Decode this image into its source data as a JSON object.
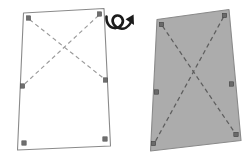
{
  "diagram": {
    "background_color": "#ffffff",
    "outline_color": "#8a8a8a",
    "dash_color_light": "#9a9a9a",
    "dash_color_dark": "#5e5e5e",
    "marker_color": "#6f6f6f",
    "fill_gray": "#acacac",
    "arrow_color": "#1b1b1b"
  },
  "left_panel": {
    "name": "unpainted-panel",
    "label": "",
    "fill": "none",
    "corners": [
      {
        "name": "top-left",
        "x": 23.5,
        "y": 13.0
      },
      {
        "name": "top-right",
        "x": 104.0,
        "y": 8.5
      },
      {
        "name": "bottom-right",
        "x": 110.5,
        "y": 146.0
      },
      {
        "name": "bottom-left",
        "x": 17.5,
        "y": 150.0
      }
    ],
    "markers": [
      {
        "name": "marker-top-left",
        "x": 28.5,
        "y": 18.0
      },
      {
        "name": "marker-top-right",
        "x": 99.5,
        "y": 14.0
      },
      {
        "name": "marker-mid-left",
        "x": 22.5,
        "y": 86.0
      },
      {
        "name": "marker-mid-right",
        "x": 105.5,
        "y": 80.0
      },
      {
        "name": "marker-bottom-left",
        "x": 24.0,
        "y": 143.0
      },
      {
        "name": "marker-bottom-right",
        "x": 105.0,
        "y": 139.0
      }
    ],
    "dashed_lines": [
      {
        "name": "diagonal-tl-to-midright",
        "x1": 29.5,
        "y1": 19.5,
        "x2": 104.5,
        "y2": 79.0
      },
      {
        "name": "diagonal-tr-to-midleft",
        "x1": 98.5,
        "y1": 15.5,
        "x2": 23.5,
        "y2": 85.0
      }
    ]
  },
  "right_panel": {
    "name": "painted-panel",
    "label": "",
    "fill": "#acacac",
    "corners": [
      {
        "name": "top-left",
        "x": 157.0,
        "y": 19.5
      },
      {
        "name": "top-right",
        "x": 229.0,
        "y": 9.5
      },
      {
        "name": "bottom-right",
        "x": 241.0,
        "y": 140.5
      },
      {
        "name": "bottom-left",
        "x": 150.5,
        "y": 151.0
      }
    ],
    "markers": [
      {
        "name": "marker-top-left",
        "x": 161.5,
        "y": 24.5
      },
      {
        "name": "marker-top-right",
        "x": 224.5,
        "y": 15.5
      },
      {
        "name": "marker-mid-left",
        "x": 156.5,
        "y": 92.0
      },
      {
        "name": "marker-mid-right",
        "x": 231.5,
        "y": 84.0
      },
      {
        "name": "marker-bottom-left",
        "x": 153.5,
        "y": 143.5
      },
      {
        "name": "marker-bottom-right",
        "x": 236.0,
        "y": 134.5
      }
    ],
    "dashed_lines": [
      {
        "name": "diagonal-tl-to-bottomright",
        "x1": 162.5,
        "y1": 26.0,
        "x2": 235.0,
        "y2": 133.0
      },
      {
        "name": "diagonal-tr-to-bottomleft",
        "x1": 223.5,
        "y1": 17.0,
        "x2": 155.0,
        "y2": 142.0
      }
    ]
  },
  "flip_symbol": {
    "name": "flip-over-arrow",
    "label": "",
    "center_x": 120,
    "center_y": 22
  }
}
